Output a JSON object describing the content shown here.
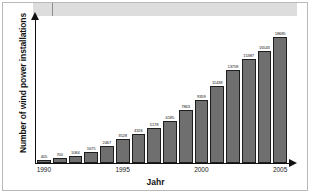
{
  "chart_data": {
    "type": "bar",
    "title": "",
    "xlabel": "Jahr",
    "ylabel": "Number of wind power installations",
    "categories": [
      "1990",
      "1991",
      "1992",
      "1993",
      "1994",
      "1995",
      "1996",
      "1997",
      "1998",
      "1999",
      "2000",
      "2001",
      "2002",
      "2003",
      "2004",
      "2005"
    ],
    "values": [
      405,
      700,
      1084,
      1675,
      2467,
      3528,
      4326,
      5178,
      6185,
      7863,
      9359,
      11438,
      13759,
      15387,
      16543,
      17600
    ],
    "bar_labels": [
      "405",
      "700",
      "1084",
      "1675",
      "2467",
      "3528",
      "4326",
      "5178",
      "6185",
      "7863",
      "9359",
      "11438",
      "13759",
      "15387",
      "16543",
      "17600"
    ],
    "xtick_labels": [
      "1990",
      "1995",
      "2000",
      "2005"
    ],
    "xtick_categories": [
      "1990",
      "1995",
      "2000",
      "2005"
    ],
    "ylim": [
      0,
      20000
    ],
    "grid": false,
    "legend": null,
    "bar_color": "#6f6f6f",
    "bar_edge_color": "#1e1e1e",
    "axis_color": "#111111",
    "background": "#ffffff",
    "top_value_label": "18685",
    "top_value": 18685
  }
}
